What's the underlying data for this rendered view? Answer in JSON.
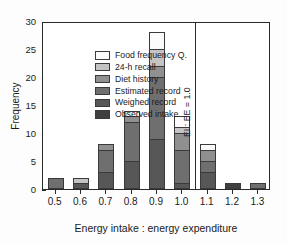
{
  "chart_data": {
    "type": "bar",
    "stacked": true,
    "title": "",
    "xlabel": "Energy intake : energy expenditure",
    "ylabel": "Frequency",
    "categories": [
      "0.5",
      "0.6",
      "0.7",
      "0.8",
      "0.9",
      "1.0",
      "1.1",
      "1.2",
      "1.3"
    ],
    "ylim": [
      0,
      30
    ],
    "yticks": [
      0,
      5,
      10,
      15,
      20,
      25,
      30
    ],
    "yticklabels": [
      "0",
      "5",
      "10",
      "15",
      "20",
      "25",
      "30"
    ],
    "grid": false,
    "legend_position": "upper left",
    "series": [
      {
        "name": "Observed intake",
        "color": "#3f3f3f",
        "values": [
          0,
          0,
          0,
          0,
          0,
          0,
          0,
          1,
          0
        ]
      },
      {
        "name": "Weighed record",
        "color": "#575757",
        "values": [
          0,
          1,
          3,
          5,
          9,
          1,
          3,
          0,
          0
        ]
      },
      {
        "name": "Estimated record",
        "color": "#6f6f6f",
        "values": [
          2,
          0,
          4,
          7,
          11,
          6,
          2,
          0,
          1
        ]
      },
      {
        "name": "Diet history",
        "color": "#909090",
        "values": [
          0,
          0,
          1,
          1,
          2,
          3,
          2,
          0,
          0
        ]
      },
      {
        "name": "24-h recall",
        "color": "#c4c4c4",
        "values": [
          0,
          1,
          0,
          0,
          3,
          1,
          0,
          0,
          0
        ]
      },
      {
        "name": "Food frequency Q.",
        "color": "#fbfbfb",
        "values": [
          0,
          0,
          0,
          1,
          3,
          2,
          1,
          0,
          0
        ]
      }
    ],
    "totals": [
      2,
      2,
      8,
      14,
      28,
      13,
      8,
      1,
      1
    ],
    "annotations": [
      {
        "name": "reference-line",
        "label": "EI : EE = 1.0",
        "x_value": 1.05,
        "orientation": "vertical"
      }
    ]
  },
  "legend": {
    "entries": [
      "Food frequency Q.",
      "24-h recall",
      "Diet history",
      "Estimated record",
      "Weighed record",
      "Observed intake"
    ]
  },
  "axes": {
    "y_title": "Frequency",
    "x_title": "Energy intake : energy expenditure"
  }
}
